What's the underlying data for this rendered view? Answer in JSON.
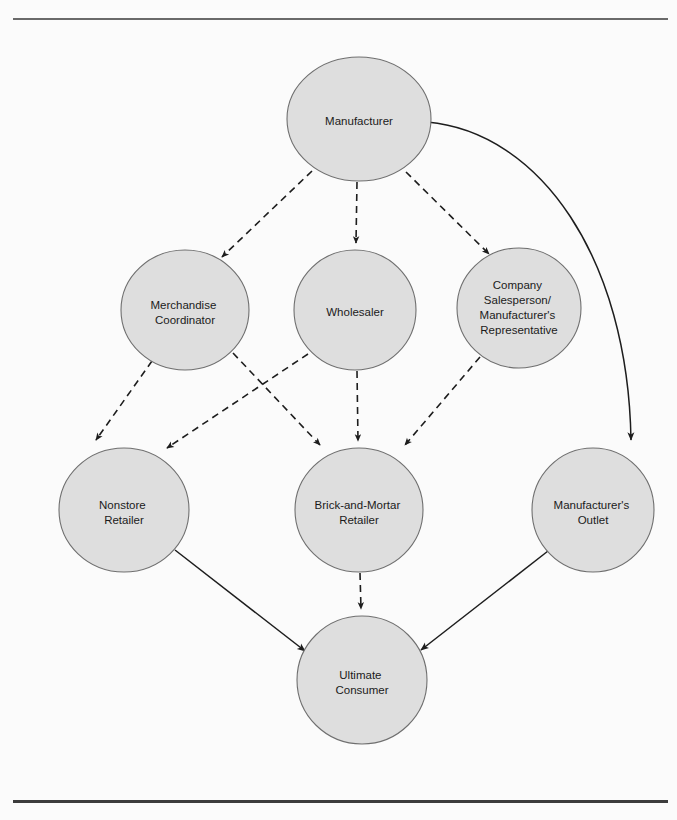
{
  "figure": {
    "background_color": "#fbfbfb",
    "node_fill_color": "#dedede",
    "node_stroke_color": "#6f6f6f",
    "edge_color": "#1d1d1d",
    "rule_color_top": "#6a6a6a",
    "rule_color_bottom": "#3c3c3c"
  },
  "diagram": {
    "type": "flow-diagram",
    "nodes": [
      {
        "id": "manufacturer",
        "label": "Manufacturer",
        "lines": [
          "Manufacturer"
        ],
        "cx": 359,
        "cy": 119,
        "rx": 72,
        "ry": 62,
        "level": 0
      },
      {
        "id": "merchandise-coordinator",
        "label": "Merchandise Coordinator",
        "lines": [
          "Merchandise",
          "Coordinator"
        ],
        "cx": 185,
        "cy": 310,
        "rx": 64,
        "ry": 60,
        "level": 1
      },
      {
        "id": "wholesaler",
        "label": "Wholesaler",
        "lines": [
          "Wholesaler"
        ],
        "cx": 355,
        "cy": 310,
        "rx": 61,
        "ry": 60,
        "level": 1
      },
      {
        "id": "company-salesperson",
        "label": "Company Salesperson/ Manufacturer's Representative",
        "lines": [
          "Company",
          "Salesperson/",
          "Manufacturer's",
          "Representative"
        ],
        "cx": 519,
        "cy": 308,
        "rx": 62,
        "ry": 60,
        "level": 1
      },
      {
        "id": "nonstore-retailer",
        "label": "Nonstore Retailer",
        "lines": [
          "Nonstore",
          "Retailer"
        ],
        "cx": 124,
        "cy": 510,
        "rx": 65,
        "ry": 62,
        "level": 2
      },
      {
        "id": "brick-and-mortar-retailer",
        "label": "Brick-and-Mortar Retailer",
        "lines": [
          "Brick-and-Mortar",
          "Retailer"
        ],
        "cx": 359,
        "cy": 510,
        "rx": 64,
        "ry": 62,
        "level": 2
      },
      {
        "id": "manufacturers-outlet",
        "label": "Manufacturer's Outlet",
        "lines": [
          "Manufacturer's",
          "Outlet"
        ],
        "cx": 593,
        "cy": 510,
        "rx": 61,
        "ry": 62,
        "level": 2
      },
      {
        "id": "ultimate-consumer",
        "label": "Ultimate Consumer",
        "lines": [
          "Ultimate",
          "Consumer"
        ],
        "cx": 362,
        "cy": 680,
        "rx": 65,
        "ry": 64,
        "level": 3
      }
    ],
    "edges": [
      {
        "id": "edge-manufacturer-merchandise-coordinator",
        "from": "manufacturer",
        "to": "merchandise-coordinator",
        "style": "dashed",
        "shape": "straight"
      },
      {
        "id": "edge-manufacturer-wholesaler",
        "from": "manufacturer",
        "to": "wholesaler",
        "style": "dashed",
        "shape": "straight"
      },
      {
        "id": "edge-manufacturer-company-salesperson",
        "from": "manufacturer",
        "to": "company-salesperson",
        "style": "dashed",
        "shape": "straight"
      },
      {
        "id": "edge-manufacturer-manufacturers-outlet",
        "from": "manufacturer",
        "to": "manufacturers-outlet",
        "style": "solid",
        "shape": "curved"
      },
      {
        "id": "edge-merchandise-coordinator-nonstore-retailer",
        "from": "merchandise-coordinator",
        "to": "nonstore-retailer",
        "style": "dashed",
        "shape": "straight"
      },
      {
        "id": "edge-merchandise-coordinator-brick-and-mortar-retailer",
        "from": "merchandise-coordinator",
        "to": "brick-and-mortar-retailer",
        "style": "dashed",
        "shape": "straight"
      },
      {
        "id": "edge-wholesaler-nonstore-retailer",
        "from": "wholesaler",
        "to": "nonstore-retailer",
        "style": "dashed",
        "shape": "straight"
      },
      {
        "id": "edge-wholesaler-brick-and-mortar-retailer",
        "from": "wholesaler",
        "to": "brick-and-mortar-retailer",
        "style": "dashed",
        "shape": "straight"
      },
      {
        "id": "edge-company-salesperson-brick-and-mortar-retailer",
        "from": "company-salesperson",
        "to": "brick-and-mortar-retailer",
        "style": "dashed",
        "shape": "straight"
      },
      {
        "id": "edge-nonstore-retailer-ultimate-consumer",
        "from": "nonstore-retailer",
        "to": "ultimate-consumer",
        "style": "solid",
        "shape": "straight"
      },
      {
        "id": "edge-brick-and-mortar-retailer-ultimate-consumer",
        "from": "brick-and-mortar-retailer",
        "to": "ultimate-consumer",
        "style": "dashed",
        "shape": "straight"
      },
      {
        "id": "edge-manufacturers-outlet-ultimate-consumer",
        "from": "manufacturers-outlet",
        "to": "ultimate-consumer",
        "style": "solid",
        "shape": "straight"
      }
    ]
  }
}
